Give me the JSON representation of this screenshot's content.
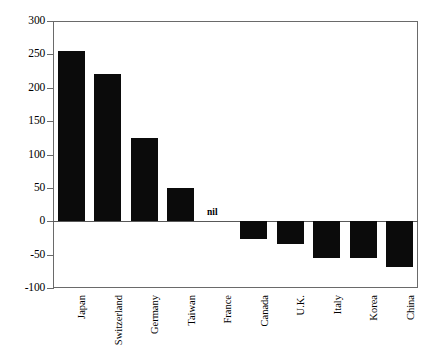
{
  "chart_data": {
    "type": "bar",
    "title": "",
    "subtitle": "",
    "xlabel": "",
    "ylabel": "",
    "categories": [
      "Japan",
      "Switzerland",
      "Germany",
      "Taiwan",
      "France",
      "Canada",
      "U.K.",
      "Italy",
      "Korea",
      "China"
    ],
    "values": [
      255,
      220,
      125,
      50,
      0,
      -27,
      -34,
      -55,
      -55,
      -69
    ],
    "point_labels": [
      "",
      "",
      "",
      "",
      "nil",
      "",
      "",
      "",
      "",
      ""
    ],
    "ylim": [
      -100,
      300
    ],
    "yticks": [
      300,
      250,
      200,
      150,
      100,
      50,
      0,
      -50,
      -100
    ],
    "ytick_labels": [
      "300",
      "250",
      "200",
      "150",
      "100",
      "50",
      "0",
      "-50",
      "-100"
    ],
    "grid": false,
    "legend": null,
    "legend_position": "none",
    "bar_color": "#0b0b0b",
    "axis_color": "#6a6a6a",
    "background_color": "#ffffff",
    "zero_line": 0,
    "annotations": [
      {
        "category": "France",
        "text": "nil"
      }
    ]
  }
}
